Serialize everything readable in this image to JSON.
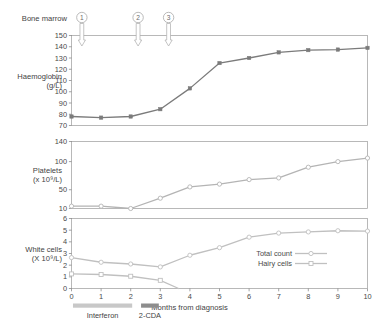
{
  "figure": {
    "bone_marrow_label": "Bone marrow",
    "markers": [
      {
        "number": "1",
        "month": 0.35
      },
      {
        "number": "2",
        "month": 2.25
      },
      {
        "number": "3",
        "month": 3.28
      }
    ],
    "xlabel": "Months from diagnosis",
    "x_ticks": [
      "0",
      "1",
      "2",
      "3",
      "4",
      "5",
      "6",
      "7",
      "8",
      "9",
      "10"
    ],
    "treatments": [
      {
        "label": "Interferon",
        "start": 0.05,
        "end": 2.05,
        "color": "#c8c8c8"
      },
      {
        "label": "2-CDA",
        "start": 2.35,
        "end": 2.95,
        "color": "#8d8d8d"
      }
    ]
  },
  "chart_data": [
    {
      "type": "line",
      "id": "haemoglobin",
      "title": "",
      "ylabel": "Haemoglobin",
      "ylabel_units": "(g/L)",
      "xlabel": "",
      "ylim": [
        70,
        150
      ],
      "y_ticks": [
        "70",
        "80",
        "90",
        "100",
        "110",
        "120",
        "130",
        "140",
        "150"
      ],
      "y_tick_values": [
        70,
        80,
        90,
        100,
        110,
        120,
        130,
        140,
        150
      ],
      "x": [
        0,
        1,
        2,
        3,
        4,
        5,
        6,
        7,
        8,
        9,
        10
      ],
      "xlim": [
        0,
        10
      ],
      "grid": false,
      "series": [
        {
          "name": "Haemoglobin",
          "values": [
            78,
            77,
            78,
            84.5,
            103,
            125.5,
            130,
            135,
            137,
            137.5,
            139
          ],
          "color": "#7b7b7b",
          "marker": "filled-square"
        }
      ]
    },
    {
      "type": "line",
      "id": "platelets",
      "title": "",
      "ylabel": "Platelets",
      "ylabel_units": "(x 10⁹/L)",
      "xlabel": "",
      "ylim": [
        10,
        140
      ],
      "y_ticks": [
        "10",
        "50",
        "100",
        "140"
      ],
      "y_tick_values": [
        10,
        50,
        100,
        140
      ],
      "x": [
        0,
        1,
        2,
        3,
        4,
        5,
        6,
        7,
        8,
        9,
        10
      ],
      "xlim": [
        0,
        10
      ],
      "grid": false,
      "series": [
        {
          "name": "Platelets",
          "values": [
            15,
            15,
            10,
            32,
            55,
            60,
            68,
            71,
            90,
            100,
            107
          ],
          "color": "#b4b4b4",
          "marker": "open-circle"
        }
      ]
    },
    {
      "type": "line",
      "id": "white-cells",
      "title": "",
      "ylabel": "White cells",
      "ylabel_units": "(X 10⁹/L)",
      "xlabel": "Months from diagnosis",
      "ylim": [
        0,
        6
      ],
      "y_ticks": [
        "0",
        "1",
        "2",
        "3",
        "4",
        "5",
        "6"
      ],
      "y_tick_values": [
        0,
        1,
        2,
        3,
        4,
        5,
        6
      ],
      "x": [
        0,
        1,
        2,
        3,
        4,
        5,
        6,
        7,
        8,
        9,
        10
      ],
      "xlim": [
        0,
        10
      ],
      "grid": false,
      "legend_position": "inside-right",
      "series": [
        {
          "name": "Total count",
          "values": [
            2.65,
            2.25,
            2.1,
            1.85,
            2.85,
            3.5,
            4.4,
            4.75,
            4.85,
            4.95,
            4.92
          ],
          "color": "#c0c0c0",
          "marker": "open-circle"
        },
        {
          "name": "Hairy cells",
          "values": [
            1.25,
            1.2,
            1.05,
            0.7,
            0,
            0,
            0,
            0,
            0,
            0,
            0
          ],
          "color": "#c0c0c0",
          "marker": "open-square",
          "visible_points": [
            0,
            1,
            2,
            3
          ],
          "drop_to_zero_at": 3.62
        }
      ]
    }
  ]
}
